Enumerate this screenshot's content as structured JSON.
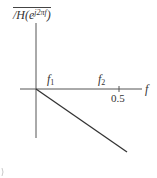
{
  "figure": {
    "y_axis_label": {
      "prefix": "/H(e",
      "exponent": "j2πf",
      "suffix": ")"
    },
    "x_axis_label": "f",
    "markers": [
      {
        "name": "f",
        "subscript": "1"
      },
      {
        "name": "f",
        "subscript": "2"
      }
    ],
    "tick_labels": [
      "0.5"
    ],
    "colors": {
      "line": "#333333",
      "axis": "#555555",
      "background": "#ffffff"
    }
  }
}
